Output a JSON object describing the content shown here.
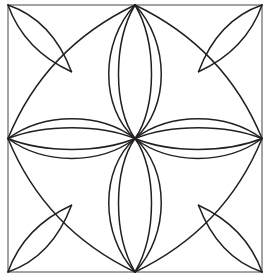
{
  "artwork": {
    "title": "Geometric Quilt Block Pattern",
    "description": "Symmetric line-art block: square frame with diagonal and mid construction guides, an eight-lobed central rosette of nested lens petals, four concave star arcs spanning edge midpoints, and four leaf shapes in the corners.",
    "style": "line-art",
    "background_color": "#ffffff"
  },
  "canvas": {
    "width": 268,
    "height": 277
  },
  "colors": {
    "background": "#ffffff",
    "frame_stroke": "#8c8c8c",
    "guide_stroke": "#d8d8d8",
    "curve_stroke": "#231f20",
    "fill": "none"
  },
  "stroke_widths": {
    "frame": 1.6,
    "guide": 1.4,
    "curve": 1.5
  },
  "geometry": {
    "frame": {
      "left": 8,
      "top": 5,
      "right": 262,
      "bottom": 272,
      "width": 254,
      "height": 267
    },
    "nodes": {
      "center": [
        135,
        138.5
      ],
      "edge_midpoints": {
        "top": [
          135,
          5
        ],
        "right": [
          262,
          138.5
        ],
        "bottom": [
          135,
          272
        ],
        "left": [
          8,
          138.5
        ]
      },
      "corners": {
        "top_left": [
          8,
          5
        ],
        "top_right": [
          262,
          5
        ],
        "bottom_right": [
          262,
          272
        ],
        "bottom_left": [
          8,
          272
        ]
      },
      "quadrant_centers": {
        "top_left": [
          71.5,
          71.75
        ],
        "top_right": [
          198.5,
          71.75
        ],
        "bottom_right": [
          198.5,
          205.25
        ],
        "bottom_left": [
          71.5,
          205.25
        ]
      }
    },
    "petals": {
      "vertical_outer_half_width": 26,
      "vertical_inner_half_width": 13,
      "horizontal_outer_half_height": 22,
      "horizontal_inner_half_height": 10,
      "count_per_axis": 2,
      "total_lobes": 8
    },
    "star_arcs": {
      "count": 4,
      "description": "concave arcs joining adjacent edge midpoints, bowing toward the corners",
      "sagitta": 30
    },
    "corner_leaves": {
      "count": 4,
      "description": "vesica lens between each corner and its quadrant center",
      "half_width": 21
    }
  },
  "guides": {
    "lines": [
      {
        "name": "diagonal-tl-br",
        "from": [
          8,
          5
        ],
        "to": [
          262,
          272
        ]
      },
      {
        "name": "diagonal-tr-bl",
        "from": [
          262,
          5
        ],
        "to": [
          8,
          272
        ]
      },
      {
        "name": "midline-horizontal",
        "from": [
          8,
          138.5
        ],
        "to": [
          262,
          138.5
        ]
      },
      {
        "name": "midline-vertical",
        "from": [
          135,
          5
        ],
        "to": [
          135,
          272
        ]
      }
    ]
  },
  "paths": {
    "frame": "M 8 5 L 262 5 L 262 272 L 8 272 Z",
    "petal_top_outer_left": "M 135 138.5 C 100 108 100 42 135 5",
    "petal_top_outer_right": "M 135 138.5 C 170 108 170 42 135 5",
    "petal_top_inner_left": "M 135 138.5 C 113 108 113 42 135 5",
    "petal_top_inner_right": "M 135 138.5 C 157 108 157 42 135 5",
    "petal_bottom_outer_left": "M 135 138.5 C 100 169 100 235 135 272",
    "petal_bottom_outer_right": "M 135 138.5 C 170 169 170 235 135 272",
    "petal_bottom_inner_left": "M 135 138.5 C 113 169 113 235 135 272",
    "petal_bottom_inner_right": "M 135 138.5 C 157 169 157 235 135 272",
    "petal_left_outer_top": "M 135 138.5 C 100 112 44 112 8 138.5",
    "petal_left_outer_bottom": "M 135 138.5 C 100 165 44 165 8 138.5",
    "petal_left_inner_top": "M 135 138.5 C 100 124 44 124 8 138.5",
    "petal_left_inner_bottom": "M 135 138.5 C 100 153 44 153 8 138.5",
    "petal_right_outer_top": "M 135 138.5 C 170 112 226 112 262 138.5",
    "petal_right_outer_bottom": "M 135 138.5 C 170 165 226 165 262 138.5",
    "petal_right_inner_top": "M 135 138.5 C 170 124 226 124 262 138.5",
    "petal_right_inner_bottom": "M 135 138.5 C 170 153 226 153 262 138.5",
    "star_arc_top_left": "M 135 5 Q 45 48 8 138.5",
    "star_arc_top_right": "M 135 5 Q 225 48 262 138.5",
    "star_arc_bottom_right": "M 262 138.5 Q 225 229 135 272",
    "star_arc_bottom_left": "M 8 138.5 Q 45 229 135 272",
    "leaf_tl_a": "M 8 5 Q 52 20 71.5 71.75",
    "leaf_tl_b": "M 8 5 Q 24 50 71.5 71.75",
    "leaf_tr_a": "M 262 5 Q 218 20 198.5 71.75",
    "leaf_tr_b": "M 262 5 Q 246 50 198.5 71.75",
    "leaf_br_a": "M 262 272 Q 218 257 198.5 205.25",
    "leaf_br_b": "M 262 272 Q 246 227 198.5 205.25",
    "leaf_bl_a": "M 8 272 Q 52 257 71.5 205.25",
    "leaf_bl_b": "M 8 272 Q 24 227 71.5 205.25"
  }
}
